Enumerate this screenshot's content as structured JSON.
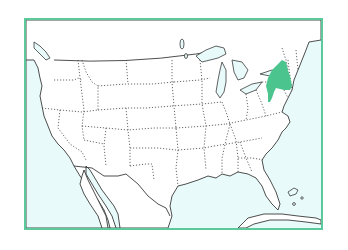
{
  "map": {
    "title": "United States map with New York highlighted",
    "region": "Contiguous United States",
    "highlighted_state": "New York",
    "colors": {
      "frame_border": "#5cc99a",
      "ocean": "#e8fafa",
      "land": "#ffffff",
      "coastline": "#3a3a3a",
      "state_border": "#444444",
      "highlight": "#4cc48e"
    },
    "layers": [
      "ocean",
      "land",
      "lakes",
      "state-borders",
      "international-borders",
      "highlighted-state"
    ]
  }
}
